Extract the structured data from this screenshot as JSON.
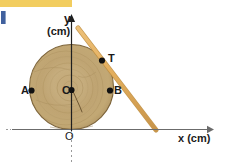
{
  "figure": {
    "axes": {
      "x_label": "x (cm)",
      "y_label": "y",
      "y_unit": "(cm)",
      "origin_label": "O"
    },
    "points": [
      {
        "id": "A",
        "label": "A",
        "desc": "left edge of disc"
      },
      {
        "id": "B",
        "label": "B",
        "desc": "right edge of disc"
      },
      {
        "id": "C",
        "label": "C",
        "desc": "center of disc"
      },
      {
        "id": "T",
        "label": "T",
        "desc": "tangent contact point on disc"
      }
    ],
    "colors": {
      "wood_light": "#c9b184",
      "wood_mid": "#b79d6d",
      "wood_dark": "#96794a",
      "wood_edge": "#6d5630",
      "stick": "#e0ab5c",
      "stick_edge": "#c08f3f",
      "axis": "#6b6b6b",
      "marker": "#111111",
      "top_bar": "#f2cd5f",
      "left_mark": "#41619e"
    }
  }
}
